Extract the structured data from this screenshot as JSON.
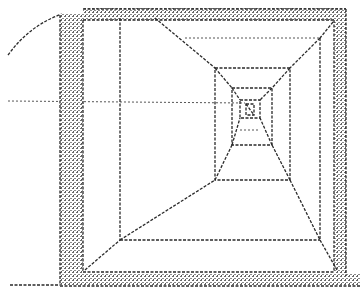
{
  "screen": {
    "title": "",
    "style": "dot-matrix wireframe 3D corridor printout",
    "colors": {
      "ink": "#2a2a2a",
      "paper": "#ffffff",
      "band": "#8a8a8a"
    }
  },
  "scene": {
    "type": "first-person wireframe corridor",
    "frame": {
      "left_band": [
        60,
        83
      ],
      "top_band": [
        8,
        20
      ],
      "right_band": [
        335,
        346
      ],
      "bottom_band": [
        274,
        286
      ]
    },
    "corridor_rects": [
      {
        "x1": 120,
        "y1": 38,
        "x2": 320,
        "y2": 240
      },
      {
        "x1": 215,
        "y1": 68,
        "x2": 290,
        "y2": 180
      },
      {
        "x1": 232,
        "y1": 88,
        "x2": 272,
        "y2": 145
      },
      {
        "x1": 240,
        "y1": 100,
        "x2": 260,
        "y2": 118
      },
      {
        "x1": 246,
        "y1": 104,
        "x2": 254,
        "y2": 115
      }
    ],
    "horizon_line_y": 101,
    "depth_levels": 5
  }
}
